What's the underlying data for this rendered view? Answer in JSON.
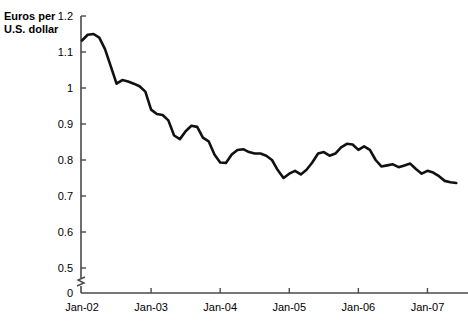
{
  "chart_data": {
    "type": "line",
    "title": "",
    "ylabel": "Euros per U.S. dollar",
    "xlabel": "",
    "ylim": [
      0.5,
      1.2
    ],
    "axis_break": true,
    "axis_break_label": "0",
    "grid": false,
    "legend": null,
    "yticks": [
      "0",
      "0.5",
      "0.6",
      "0.7",
      "0.8",
      "0.9",
      "1",
      "1.1",
      "1.2"
    ],
    "ytick_values": [
      0,
      0.5,
      0.6,
      0.7,
      0.8,
      0.9,
      1.0,
      1.1,
      1.2
    ],
    "xticks": [
      "Jan-02",
      "Jan-03",
      "Jan-04",
      "Jan-05",
      "Jan-06",
      "Jan-07"
    ],
    "xtick_values": [
      2002.0,
      2003.0,
      2004.0,
      2005.0,
      2006.0,
      2007.0
    ],
    "xlim": [
      2002.0,
      2007.5
    ],
    "series": [
      {
        "name": "Euros per U.S. dollar",
        "color": "#111111",
        "x": [
          2002.0,
          2002.083,
          2002.167,
          2002.25,
          2002.333,
          2002.417,
          2002.5,
          2002.583,
          2002.667,
          2002.75,
          2002.833,
          2002.917,
          2003.0,
          2003.083,
          2003.167,
          2003.25,
          2003.333,
          2003.417,
          2003.5,
          2003.583,
          2003.667,
          2003.75,
          2003.833,
          2003.917,
          2004.0,
          2004.083,
          2004.167,
          2004.25,
          2004.333,
          2004.417,
          2004.5,
          2004.583,
          2004.667,
          2004.75,
          2004.833,
          2004.917,
          2005.0,
          2005.083,
          2005.167,
          2005.25,
          2005.333,
          2005.417,
          2005.5,
          2005.583,
          2005.667,
          2005.75,
          2005.833,
          2005.917,
          2006.0,
          2006.083,
          2006.167,
          2006.25,
          2006.333,
          2006.417,
          2006.5,
          2006.583,
          2006.667,
          2006.75,
          2006.833,
          2006.917,
          2007.0,
          2007.083,
          2007.167,
          2007.25,
          2007.333,
          2007.417
        ],
        "y": [
          1.132,
          1.148,
          1.15,
          1.14,
          1.108,
          1.06,
          1.012,
          1.022,
          1.018,
          1.012,
          1.005,
          0.99,
          0.94,
          0.928,
          0.925,
          0.91,
          0.868,
          0.858,
          0.88,
          0.895,
          0.892,
          0.862,
          0.852,
          0.815,
          0.793,
          0.792,
          0.815,
          0.828,
          0.83,
          0.822,
          0.818,
          0.818,
          0.812,
          0.8,
          0.772,
          0.75,
          0.762,
          0.77,
          0.76,
          0.773,
          0.793,
          0.818,
          0.822,
          0.812,
          0.818,
          0.835,
          0.845,
          0.843,
          0.828,
          0.838,
          0.828,
          0.8,
          0.782,
          0.785,
          0.788,
          0.78,
          0.785,
          0.79,
          0.775,
          0.762,
          0.77,
          0.765,
          0.755,
          0.742,
          0.738,
          0.736
        ]
      }
    ]
  }
}
